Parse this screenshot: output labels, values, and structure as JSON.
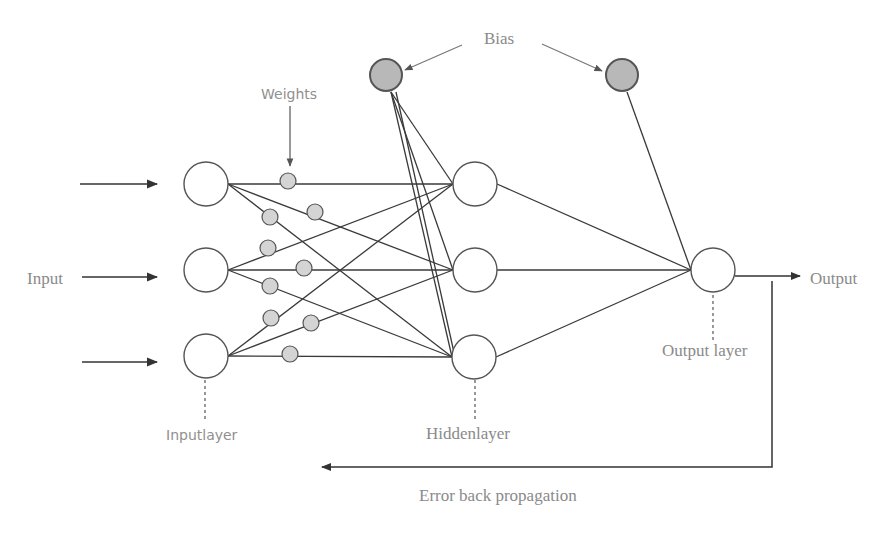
{
  "labels": {
    "bias": "Bias",
    "weights": "Weights",
    "input": "Input",
    "output": "Output",
    "input_layer": "Inputlayer",
    "hidden_layer": "Hiddenlayer",
    "output_layer": "Output layer",
    "error_back_propagation": "Error back propagation"
  },
  "colors": {
    "line": "#3a3a3a",
    "node_fill": "#ffffff",
    "weight_fill": "#d4d4d4",
    "bias_fill": "#b8b8b8",
    "label": "#8a8a8a"
  },
  "nodes": {
    "input": [
      {
        "cx": 206,
        "cy": 184
      },
      {
        "cx": 206,
        "cy": 270
      },
      {
        "cx": 206,
        "cy": 356
      }
    ],
    "hidden": [
      {
        "cx": 475,
        "cy": 184
      },
      {
        "cx": 475,
        "cy": 270
      },
      {
        "cx": 474,
        "cy": 357
      }
    ],
    "output": [
      {
        "cx": 713,
        "cy": 270
      }
    ],
    "bias": [
      {
        "cx": 386,
        "cy": 75
      },
      {
        "cx": 622,
        "cy": 75
      }
    ],
    "weights": [
      {
        "cx": 288,
        "cy": 181
      },
      {
        "cx": 315,
        "cy": 212
      },
      {
        "cx": 270,
        "cy": 217
      },
      {
        "cx": 268,
        "cy": 248
      },
      {
        "cx": 304,
        "cy": 268
      },
      {
        "cx": 270,
        "cy": 286
      },
      {
        "cx": 271,
        "cy": 318
      },
      {
        "cx": 311,
        "cy": 323
      },
      {
        "cx": 290,
        "cy": 354
      }
    ]
  }
}
